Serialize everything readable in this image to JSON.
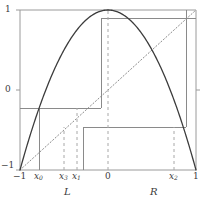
{
  "figure": {
    "name": "cobweb-diagram",
    "colors": {
      "curve": "#3c3c3c",
      "frame": "#9a9a9a",
      "cobweb": "#8a8a8a",
      "dashed": "#a8a8a8",
      "diagonal": "#8a8a8a",
      "text": "#3a3a3a",
      "background": "#ffffff"
    }
  },
  "axes": {
    "xlim": [
      -1,
      1
    ],
    "ylim": [
      -1,
      1
    ],
    "y_ticks": [
      {
        "label": "1",
        "value": 1
      },
      {
        "label": "0",
        "value": 0
      },
      {
        "label": "−1",
        "value": -1
      }
    ],
    "x_ticks": [
      {
        "label": "−1",
        "sub": "",
        "value": -1
      },
      {
        "label": "x",
        "sub": "0",
        "value": -0.78
      },
      {
        "label": "x",
        "sub": "3",
        "value": -0.5
      },
      {
        "label": "x",
        "sub": "1",
        "value": -0.355
      },
      {
        "label": "0",
        "sub": "",
        "value": 0
      },
      {
        "label": "x",
        "sub": "2",
        "value": 0.755
      },
      {
        "label": "1",
        "sub": "",
        "value": 1
      }
    ],
    "region_labels": [
      {
        "label": "L",
        "value": -0.5
      },
      {
        "label": "R",
        "value": 0.5
      }
    ]
  },
  "chart_data": {
    "type": "line",
    "title": "",
    "xlabel": "",
    "ylabel": "",
    "xlim": [
      -1,
      1
    ],
    "ylim": [
      -1,
      1
    ],
    "grid": false,
    "legend": "none",
    "series": [
      {
        "name": "f(x) = 1 - 2x^2",
        "style": "solid",
        "color": "#3c3c3c",
        "x": [
          -1,
          -0.9,
          -0.8,
          -0.7,
          -0.6,
          -0.5,
          -0.4,
          -0.3,
          -0.2,
          -0.1,
          0,
          0.1,
          0.2,
          0.3,
          0.4,
          0.5,
          0.6,
          0.7,
          0.8,
          0.9,
          1
        ],
        "y": [
          -1,
          -0.62,
          -0.28,
          0.02,
          0.28,
          0.5,
          0.68,
          0.82,
          0.92,
          0.98,
          1,
          0.98,
          0.92,
          0.82,
          0.68,
          0.5,
          0.28,
          0.02,
          -0.28,
          -0.62,
          -1
        ]
      },
      {
        "name": "y = x (diagonal)",
        "style": "dotted",
        "color": "#8a8a8a",
        "x": [
          -1,
          1
        ],
        "y": [
          -1,
          1
        ]
      }
    ],
    "cobweb": {
      "name": "orbit-cobweb",
      "style": "solid",
      "color": "#8a8a8a",
      "points": [
        {
          "x": -0.78,
          "y": -1.0
        },
        {
          "x": -0.78,
          "y": -0.22
        },
        {
          "x": -1.0,
          "y": -0.22
        },
        {
          "x": -1.0,
          "y": 1.0
        },
        {
          "x": -0.355,
          "y": 1.0
        },
        {
          "x": -0.355,
          "y": 0.9
        },
        {
          "x": -1.0,
          "y": 0.9
        },
        {
          "x": -0.355,
          "y": -0.46
        },
        {
          "x": 0.755,
          "y": -0.46
        },
        {
          "x": 0.755,
          "y": 1.0
        },
        {
          "x": 1.0,
          "y": 1.0
        },
        {
          "x": 1.0,
          "y": 0.0
        }
      ]
    },
    "dashed_verticals": [
      {
        "label": "x3",
        "x": -0.5,
        "y_top": -0.46
      },
      {
        "label": "x1",
        "x": -0.355,
        "y_top": -0.22
      },
      {
        "label": "0",
        "x": 0.0,
        "y_top": 1.0
      },
      {
        "label": "x2",
        "x": 0.755,
        "y_top": -0.46
      }
    ]
  }
}
